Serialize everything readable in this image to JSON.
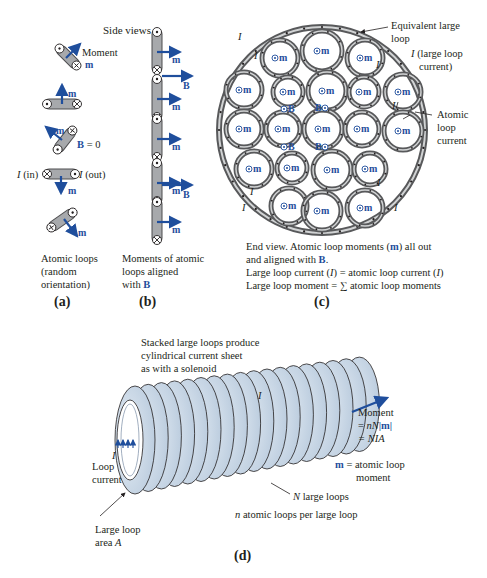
{
  "figure": {
    "colors": {
      "vector_blue": "#1f4e9c",
      "loop_gray": "#a7a9ac",
      "loop_dark": "#4d4d4f",
      "solenoid_fill": "#c9d7e6",
      "text": "#231f20"
    },
    "panel_a": {
      "caption": "(a)",
      "title": "Side views",
      "moment_label": "Moment",
      "m": "m",
      "b_zero": "B = 0",
      "b_sym": "B",
      "b_eq": " = 0",
      "i_in": "I (in)",
      "i_out": "I (out)",
      "i_sym": "I",
      "in_text": " (in)",
      "out_text": " (out)",
      "desc_lines": [
        "Atomic loops",
        "(random",
        "orientation)"
      ]
    },
    "panel_b": {
      "caption": "(b)",
      "m": "m",
      "b": "B",
      "desc_lines": [
        "Moments of atomic",
        "loops aligned",
        "with "
      ],
      "desc_b": "B"
    },
    "panel_c": {
      "caption": "(c)",
      "equivalent_label_lines": [
        "Equivalent large",
        "loop"
      ],
      "large_current_lines": [
        "(large loop",
        "current)"
      ],
      "atomic_current_lines": [
        "Atomic",
        "loop",
        "current"
      ],
      "i": "I",
      "m": "m",
      "b": "B",
      "end_view_lines": [
        "End view.  Atomic loop moments (",
        ") all out",
        "and aligned with ",
        "."
      ],
      "large_current_eq_a": "Large loop current (",
      "large_current_eq_b": ") = atomic loop current (",
      "large_current_eq_c": ")",
      "large_moment_eq": "Large loop moment = ∑ atomic loop moments"
    },
    "panel_d": {
      "caption": "(d)",
      "stacked_lines": [
        "Stacked large loops produce",
        "cylindrical current sheet",
        "as with a solenoid"
      ],
      "moment_title": "Moment",
      "moment_eq1_a": "= ",
      "moment_eq1_nN": "nN",
      "moment_eq1_m": "|m|",
      "moment_eq2": "= NIA",
      "m_def_m": "m",
      "m_def_lines": [
        " = atomic loop",
        "moment"
      ],
      "n_large": "N large loops",
      "n_large_N": "N",
      "n_large_rest": " large loops",
      "n_atomic_n": "n",
      "n_atomic_rest": " atomic loops per large loop",
      "loop_current_lines": [
        "Loop",
        "current"
      ],
      "i": "I",
      "area_lines": [
        "Large loop",
        "area "
      ],
      "area_A": "A"
    }
  }
}
